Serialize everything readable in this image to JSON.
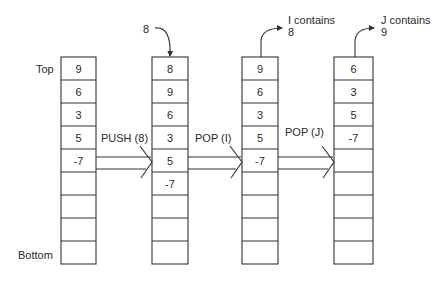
{
  "labels": {
    "top": "Top",
    "bottom": "Bottom"
  },
  "stacks": [
    {
      "id": "initial",
      "cells": [
        "9",
        "6",
        "3",
        "5",
        "-7",
        "",
        "",
        "",
        ""
      ]
    },
    {
      "id": "after-push",
      "cells": [
        "8",
        "9",
        "6",
        "3",
        "5",
        "-7",
        "",
        "",
        ""
      ],
      "incoming_label": "8"
    },
    {
      "id": "after-pop-i",
      "cells": [
        "9",
        "6",
        "3",
        "5",
        "-7",
        "",
        "",
        "",
        ""
      ],
      "outgoing_label_line1": "I contains",
      "outgoing_label_line2": "8"
    },
    {
      "id": "after-pop-j",
      "cells": [
        "6",
        "3",
        "5",
        "-7",
        "",
        "",
        "",
        "",
        ""
      ],
      "outgoing_label_line1": "J contains",
      "outgoing_label_line2": "9"
    }
  ],
  "operations": [
    {
      "label": "PUSH (8)"
    },
    {
      "label": "POP (I)"
    },
    {
      "label": "POP (J)"
    }
  ],
  "colors": {
    "stroke": "#333333",
    "text": "#2a2a2a",
    "background": "#ffffff"
  }
}
